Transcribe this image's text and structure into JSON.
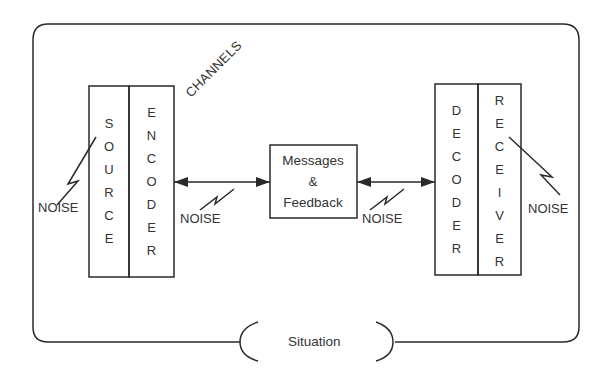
{
  "diagram": {
    "type": "communication-model",
    "colors": {
      "line": "#2a2a2a",
      "text": "#333333",
      "background": "#ffffff"
    },
    "source": {
      "letters": [
        "S",
        "O",
        "U",
        "R",
        "C",
        "E"
      ],
      "label": "SOURCE"
    },
    "encoder": {
      "letters": [
        "E",
        "N",
        "C",
        "O",
        "D",
        "E",
        "R"
      ],
      "label": "ENCODER"
    },
    "decoder": {
      "letters": [
        "D",
        "E",
        "C",
        "O",
        "D",
        "E",
        "R"
      ],
      "label": "DECODER"
    },
    "receiver": {
      "letters": [
        "R",
        "E",
        "C",
        "E",
        "I",
        "V",
        "E",
        "R"
      ],
      "label": "RECEIVER"
    },
    "channels_label": "CHANNELS",
    "messages": {
      "line1": "Messages",
      "line2": "&",
      "line3": "Feedback"
    },
    "noise_labels": [
      "NOISE",
      "NOISE",
      "NOISE",
      "NOISE"
    ],
    "situation_label": "Situation"
  }
}
